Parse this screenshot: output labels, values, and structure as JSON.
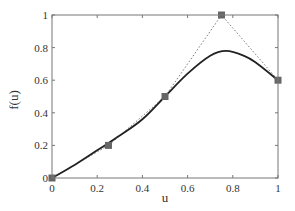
{
  "chart_data": {
    "type": "line",
    "title": "",
    "xlabel": "u",
    "ylabel": "f(u)",
    "xlim": [
      0,
      1
    ],
    "ylim": [
      0,
      1
    ],
    "xticks": [
      0,
      0.2,
      0.4,
      0.6,
      0.8,
      1
    ],
    "yticks": [
      0,
      0.2,
      0.4,
      0.6,
      0.8,
      1
    ],
    "xtick_labels": [
      "0",
      "0.2",
      "0.4",
      "0.6",
      "0.8",
      "1"
    ],
    "ytick_labels": [
      "0",
      "0.2",
      "0.4",
      "0.6",
      "0.8",
      "1"
    ],
    "grid": false,
    "legend": null,
    "series": [
      {
        "name": "control points",
        "style": "dotted line with square markers",
        "color": "#555555",
        "marker_color": "#666666",
        "x": [
          0,
          0.25,
          0.5,
          0.75,
          1
        ],
        "y": [
          0,
          0.2,
          0.5,
          1.0,
          0.6
        ]
      },
      {
        "name": "f(u) curve",
        "style": "solid",
        "color": "#222222",
        "x": [
          0,
          0.1,
          0.2,
          0.3,
          0.4,
          0.5,
          0.6,
          0.7,
          0.77,
          0.85,
          0.9,
          1.0
        ],
        "y": [
          0,
          0.08,
          0.17,
          0.26,
          0.36,
          0.5,
          0.64,
          0.75,
          0.78,
          0.75,
          0.71,
          0.6
        ]
      }
    ]
  }
}
